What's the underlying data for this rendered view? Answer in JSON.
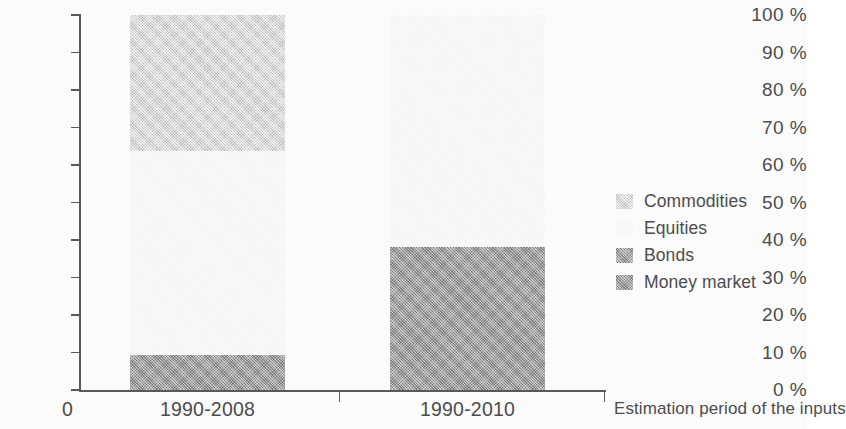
{
  "chart_data": {
    "type": "bar",
    "subtype": "stacked-100-percent",
    "title": "",
    "xlabel": "Estimation period of the inputs",
    "ylabel": "",
    "categories": [
      "1990-2008",
      "1990-2010"
    ],
    "ytick_labels": [
      "0 %",
      "10 %",
      "20 %",
      "30 %",
      "40 %",
      "50 %",
      "60 %",
      "70 %",
      "80 %",
      "90 %",
      "100 %"
    ],
    "ytick_values": [
      0,
      10,
      20,
      30,
      40,
      50,
      60,
      70,
      80,
      90,
      100
    ],
    "ylim": [
      0,
      100
    ],
    "grid": false,
    "legend_position": "right",
    "origin_label": "0",
    "series": [
      {
        "name": "Money market",
        "color": "#a2a2a2",
        "values": [
          9.3,
          38.1
        ]
      },
      {
        "name": "Bonds",
        "color": "#a3a3a3",
        "values": [
          0,
          0
        ]
      },
      {
        "name": "Equities",
        "color": "#fcfcfc",
        "values": [
          54.4,
          61.9
        ]
      },
      {
        "name": "Commodities",
        "color": "#d9d9d9",
        "values": [
          36.3,
          0
        ]
      }
    ],
    "legend_entries": [
      {
        "label": "Commodities",
        "color": "#d9d9d9",
        "swatch": "commodities-swatch"
      },
      {
        "label": "Equities",
        "color": "#fcfcfc",
        "swatch": "equities-swatch"
      },
      {
        "label": "Bonds",
        "color": "#a3a3a3",
        "swatch": "bonds-swatch"
      },
      {
        "label": "Money market",
        "color": "#a2a2a2",
        "swatch": "money-market-swatch"
      }
    ],
    "axis_color": "#5b5b5b",
    "text_color": "#4e4e4e",
    "background": "#ffffff"
  }
}
